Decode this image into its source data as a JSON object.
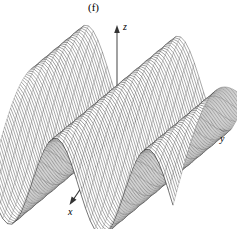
{
  "figure": {
    "panel_label": "(f)",
    "type": "3d-surface-mesh",
    "background_color": "#ffffff",
    "mesh_color": "#000000"
  },
  "axes": {
    "x": {
      "label": "x",
      "icon": "arrow-down-left-icon"
    },
    "y": {
      "label": "y",
      "icon": "arrow-right-icon"
    },
    "z": {
      "label": "z",
      "icon": "arrow-up-icon"
    }
  },
  "chart_data": {
    "type": "line",
    "title": "(f)",
    "xlabel": "x",
    "ylabel": "y",
    "zlabel": "z",
    "surface": {
      "description": "Periodic corrugated wave surface with four ridges and four sharp troughs, rendered as a fine wireframe mesh in 3D oblique projection.",
      "function": "z = cos(a*x + b*y) style travelling-wave corrugation",
      "ridge_count": 4,
      "trough_count": 4,
      "u_samples": 61,
      "v_samples": 41,
      "xlim": [
        -1,
        1
      ],
      "ylim": [
        -1,
        1
      ],
      "zlim": [
        -1,
        1
      ],
      "grid": false,
      "legend": "none"
    },
    "categories": [],
    "values": []
  }
}
